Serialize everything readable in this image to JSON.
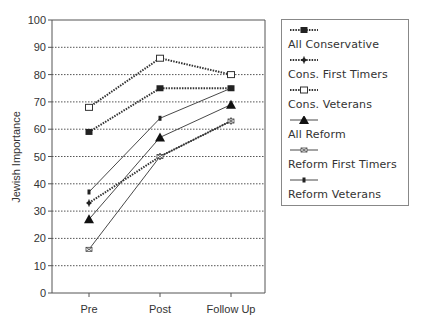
{
  "chart_data": {
    "type": "line",
    "title": "",
    "xlabel": "",
    "ylabel": "Jewish Importance",
    "ylim": [
      0,
      100
    ],
    "yticks": [
      0,
      10,
      20,
      30,
      40,
      50,
      60,
      70,
      80,
      90,
      100
    ],
    "grid": "horizontal dotted",
    "legend_position": "right",
    "categories": [
      "Pre",
      "Post",
      "Follow Up"
    ],
    "series": [
      {
        "name": "All Conservative",
        "values": [
          59,
          75,
          75
        ],
        "style": "dotted",
        "marker": "filled-square"
      },
      {
        "name": "Cons. First Timers",
        "values": [
          33,
          50,
          63
        ],
        "style": "dotted",
        "marker": "filled-diamond"
      },
      {
        "name": "Cons. Veterans",
        "values": [
          68,
          86,
          80
        ],
        "style": "dotted",
        "marker": "open-square"
      },
      {
        "name": "All Reform",
        "values": [
          27,
          57,
          69
        ],
        "style": "solid",
        "marker": "filled-triangle"
      },
      {
        "name": "Reform First Timers",
        "values": [
          16,
          50,
          63
        ],
        "style": "solid",
        "marker": "x-square"
      },
      {
        "name": "Reform Veterans",
        "values": [
          37,
          64,
          75
        ],
        "style": "solid",
        "marker": "small-dash"
      }
    ]
  },
  "legend": {
    "items": [
      {
        "label": "All Conservative"
      },
      {
        "label": "Cons. First Timers"
      },
      {
        "label": "Cons. Veterans"
      },
      {
        "label": "All Reform"
      },
      {
        "label": "Reform First Timers"
      },
      {
        "label": "Reform Veterans"
      }
    ]
  },
  "axes": {
    "ylabel": "Jewish Importance",
    "xticks": [
      "Pre",
      "Post",
      "Follow Up"
    ],
    "yticks": [
      "0",
      "10",
      "20",
      "30",
      "40",
      "50",
      "60",
      "70",
      "80",
      "90",
      "100"
    ]
  }
}
